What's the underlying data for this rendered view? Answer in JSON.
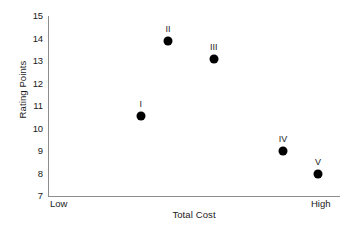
{
  "chart_data": {
    "type": "scatter",
    "title": "",
    "xlabel": "Total Cost",
    "ylabel": "Rating Points",
    "xlim": [
      "Low",
      "High"
    ],
    "ylim": [
      7,
      15
    ],
    "yticks": [
      15,
      14,
      13,
      12,
      11,
      10,
      9,
      8,
      7
    ],
    "x_end_labels": {
      "left": "Low",
      "right": "High"
    },
    "grid": false,
    "legend": null,
    "marker_color": "#000000",
    "axis_color": "#8d8d8d",
    "points": [
      {
        "label": "I",
        "x": 0.318,
        "y": 10.55
      },
      {
        "label": "II",
        "x": 0.411,
        "y": 13.9
      },
      {
        "label": "III",
        "x": 0.568,
        "y": 13.1
      },
      {
        "label": "IV",
        "x": 0.805,
        "y": 9.0
      },
      {
        "label": "V",
        "x": 0.925,
        "y": 8.0
      }
    ]
  }
}
